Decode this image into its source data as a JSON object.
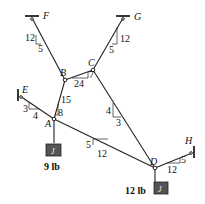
{
  "diagram": {
    "type": "cable-system",
    "nodes": {
      "A": {
        "label": "A",
        "x": 54,
        "y": 119
      },
      "B": {
        "label": "B",
        "x": 65,
        "y": 80
      },
      "C": {
        "label": "C",
        "x": 93,
        "y": 70
      },
      "D": {
        "label": "D",
        "x": 155,
        "y": 168
      }
    },
    "supports": {
      "E": {
        "label": "E",
        "x": 20,
        "y": 96
      },
      "F": {
        "label": "F",
        "x": 32,
        "y": 17
      },
      "G": {
        "label": "G",
        "x": 123,
        "y": 17
      },
      "H": {
        "label": "H",
        "x": 192,
        "y": 153
      }
    },
    "slopes": {
      "FB": {
        "rise": "12",
        "run": "5"
      },
      "GC": {
        "rise": "12",
        "run": "5"
      },
      "BC": {
        "rise": "7",
        "run": "24"
      },
      "AB": {
        "rise": "15",
        "run": "8"
      },
      "EA": {
        "rise": "3",
        "run": "4"
      },
      "CD": {
        "rise": "4",
        "run": "3"
      },
      "AD": {
        "rise": "5",
        "run": "12"
      },
      "DH": {
        "rise": "5",
        "run": "12"
      }
    },
    "loads": {
      "A": {
        "value": "9 lb"
      },
      "D": {
        "value": "12 lb"
      }
    },
    "colors": {
      "line": "#222222",
      "weight": "#555555"
    }
  }
}
